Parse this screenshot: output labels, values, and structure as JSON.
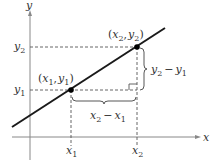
{
  "diagram": {
    "axes": {
      "x_label": "x",
      "y_label": "y"
    },
    "points": [
      {
        "name": "point-1",
        "label": "(x1, y1)",
        "x_var": "x",
        "x_sub": "1",
        "y_var": "y",
        "y_sub": "1"
      },
      {
        "name": "point-2",
        "label": "(x2, y2)",
        "x_var": "x",
        "x_sub": "2",
        "y_var": "y",
        "y_sub": "2"
      }
    ],
    "tick_labels": {
      "x1": {
        "var": "x",
        "sub": "1"
      },
      "x2": {
        "var": "x",
        "sub": "2"
      },
      "y1": {
        "var": "y",
        "sub": "1"
      },
      "y2": {
        "var": "y",
        "sub": "2"
      }
    },
    "run_label": "x2 − x1",
    "rise_label": "y2 − y1",
    "minus": "−",
    "open_paren": "(",
    "close_paren": ")",
    "comma": ",",
    "colors": {
      "line": "#1a1a1a",
      "axis": "#777777",
      "dashed": "#555555",
      "text": "#333333"
    }
  }
}
